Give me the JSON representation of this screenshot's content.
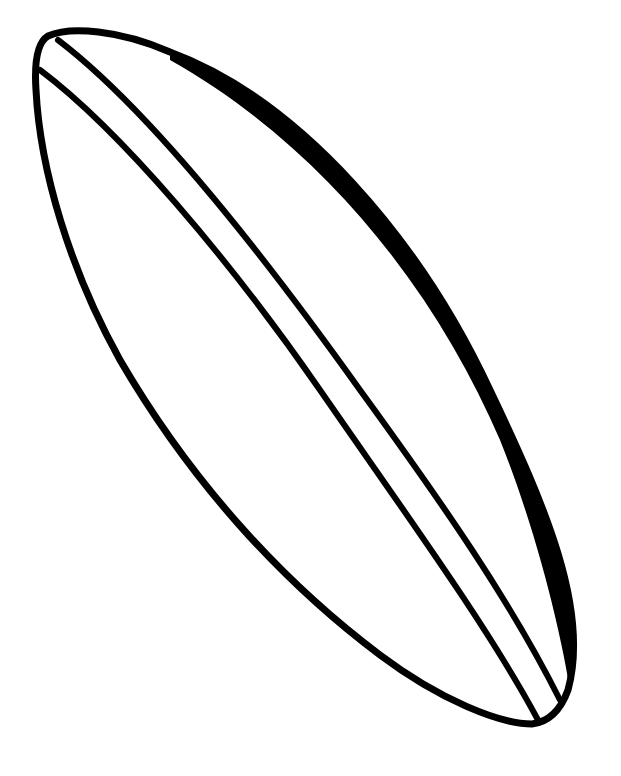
{
  "image": {
    "subject": "Surfboard line drawing",
    "style": "black ink outline on white",
    "colors": {
      "background": "#ffffff",
      "ink": "#000000"
    }
  }
}
